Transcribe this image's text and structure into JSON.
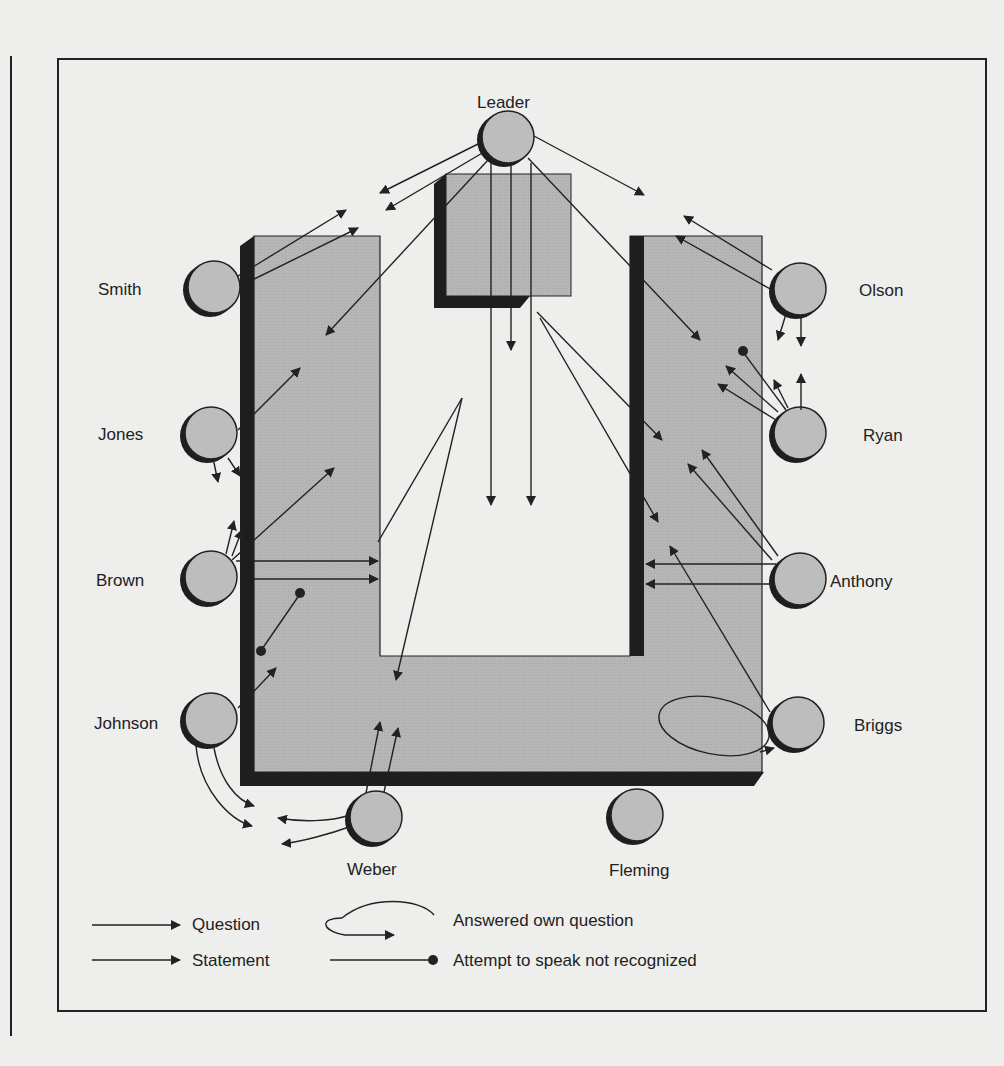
{
  "diagram": {
    "type": "participation-flow-diagram",
    "participants": [
      {
        "id": "leader",
        "name": "Leader"
      },
      {
        "id": "smith",
        "name": "Smith"
      },
      {
        "id": "jones",
        "name": "Jones"
      },
      {
        "id": "brown",
        "name": "Brown"
      },
      {
        "id": "johnson",
        "name": "Johnson"
      },
      {
        "id": "weber",
        "name": "Weber"
      },
      {
        "id": "fleming",
        "name": "Fleming"
      },
      {
        "id": "olson",
        "name": "Olson"
      },
      {
        "id": "ryan",
        "name": "Ryan"
      },
      {
        "id": "anthony",
        "name": "Anthony"
      },
      {
        "id": "briggs",
        "name": "Briggs"
      }
    ],
    "table_shape": "U-shaped table with lectern at top center"
  },
  "legend": {
    "question": "Question",
    "statement": "Statement",
    "answered_own": "Answered own question",
    "not_recognized": "Attempt to speak not recognized"
  },
  "colors": {
    "paper": "#eeeeec",
    "table_fill": "#b4b4b4",
    "shadow": "#1e1e1e",
    "ink": "#222222",
    "seat_fill": "#bdbdbd"
  }
}
